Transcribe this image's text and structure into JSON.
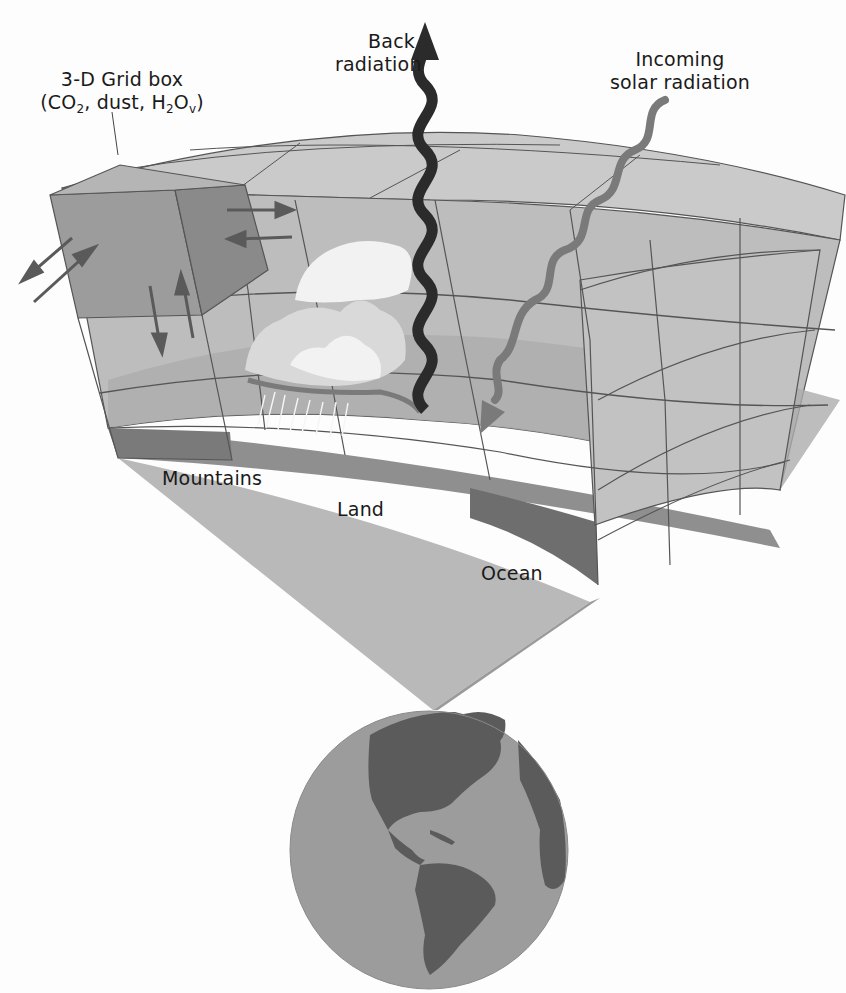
{
  "figure": {
    "colors": {
      "background": "#fdfdfd",
      "grid_top": "#c9c9c9",
      "grid_face": "#bdbdbd",
      "grid_box_front": "#9c9c9c",
      "grid_box_side": "#8a8a8a",
      "grid_lines": "#555555",
      "surface_wedge": "#b8b8b8",
      "land_band": "#8f8f8f",
      "ocean_band": "#6e6e6e",
      "back_radiation_arrow": "#2b2b2b",
      "solar_radiation_arrow": "#7a7a7a",
      "exchange_arrows": "#5a5a5a",
      "cloud": "#f2f2f2",
      "globe_ocean": "#9a9a9a",
      "globe_land": "#5b5b5b"
    }
  },
  "labels": {
    "grid_box": {
      "line1": "3-D Grid box",
      "line2_open": "(CO",
      "line2_sub1": "2",
      "line2_mid": ", dust, H",
      "line2_sub2": "2",
      "line2_o": "O",
      "line2_sub3": "v",
      "line2_close": ")"
    },
    "back_radiation": {
      "line1": "Back",
      "line2": "radiation"
    },
    "incoming_solar": {
      "line1": "Incoming",
      "line2": "solar radiation"
    },
    "mountains": "Mountains",
    "land": "Land",
    "ocean": "Ocean"
  },
  "icons": {
    "back_radiation_arrow": "wavy-up-arrow",
    "solar_radiation_arrow": "wavy-down-arrow",
    "horizontal_exchange_arrows": "double-arrow",
    "vertical_exchange_arrows": "up-down-arrows",
    "cloud": "cumulus-cloud-with-rain",
    "globe": "earth-americas"
  }
}
